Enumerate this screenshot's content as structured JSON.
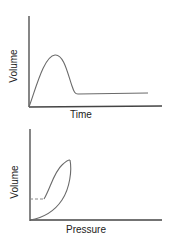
{
  "colors": {
    "background": "#ffffff",
    "axis": "#444444",
    "curve": "#6a6a6a",
    "text": "#222222"
  },
  "diagrams": [
    {
      "id": "volume-time",
      "xlabel": "Time",
      "ylabel": "Volume",
      "description": "Volume rises from zero to a peak, falls back, then stays level at a low plateau"
    },
    {
      "id": "pressure-volume",
      "xlabel": "Pressure",
      "ylabel": "Volume",
      "description": "Pressure-volume loop with a dashed horizontal baseline segment at low volume"
    }
  ]
}
